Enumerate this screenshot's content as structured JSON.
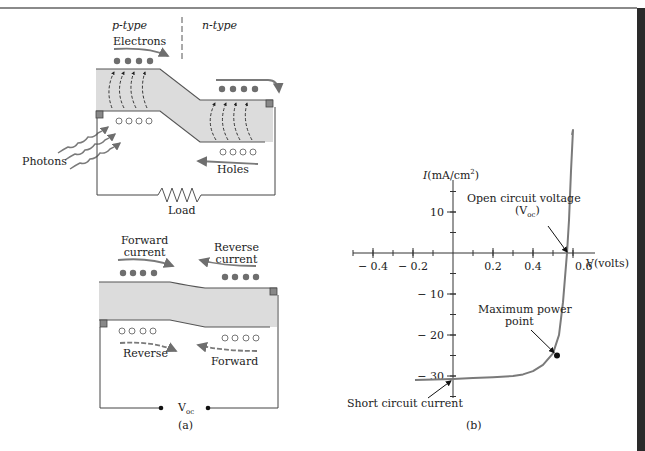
{
  "panel_a": {
    "top": {
      "p_type": "p-type",
      "n_type": "n-type",
      "electrons": "Electrons",
      "photons": "Photons",
      "holes": "Holes",
      "load": "Load"
    },
    "bottom": {
      "forward_current_1": "Forward",
      "forward_current_2": "current",
      "reverse_current_1": "Reverse",
      "reverse_current_2": "current",
      "reverse": "Reverse",
      "forward": "Forward",
      "voc_main": "V",
      "voc_sub": "oc"
    },
    "caption": "(a)"
  },
  "panel_b": {
    "caption": "(b)",
    "annotations": {
      "open_circuit_1": "Open circuit voltage",
      "open_circuit_2_main": "(V",
      "open_circuit_2_sub": "oc",
      "open_circuit_2_end": ")",
      "max_power_1": "Maximum power",
      "max_power_2": "point",
      "short_circuit": "Short circuit current"
    }
  },
  "colors": {
    "band_fill": "#dcdcdc",
    "curve": "#7a7a7a",
    "dots": "#6e6e6e",
    "dark_bar": "#2a2a2a"
  },
  "chart_data": {
    "type": "line",
    "title": "",
    "xlabel": "V(volts)",
    "ylabel": "I(mA/cm²)",
    "xlim": [
      -0.45,
      0.6
    ],
    "ylim": [
      -35,
      20
    ],
    "x_ticks": [
      -0.4,
      -0.2,
      0.2,
      0.4,
      0.6
    ],
    "x_tick_labels": [
      "− 0.4",
      "− 0.2",
      "0.2",
      "0.4",
      "0.6"
    ],
    "y_ticks": [
      10,
      -10,
      -20,
      -30
    ],
    "y_tick_labels": [
      "10",
      "− 10",
      "− 20",
      "− 30"
    ],
    "series": [
      {
        "name": "I-V curve",
        "x": [
          -0.19,
          0.0,
          0.1,
          0.2,
          0.3,
          0.35,
          0.4,
          0.45,
          0.5,
          0.53,
          0.55,
          0.56,
          0.57,
          0.58,
          0.59,
          0.6
        ],
        "y": [
          -31.0,
          -30.7,
          -30.5,
          -30.3,
          -30.0,
          -29.6,
          -28.8,
          -27.3,
          -24.5,
          -20,
          -12,
          -6,
          0,
          8,
          20,
          30
        ]
      }
    ],
    "points": {
      "open_circuit_voltage": {
        "x": 0.58,
        "y": 0
      },
      "maximum_power_point": {
        "x": 0.52,
        "y": -25
      },
      "short_circuit_current": {
        "x": 0.0,
        "y": -30.7
      }
    },
    "grid": false
  }
}
